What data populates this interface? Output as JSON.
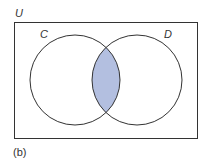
{
  "diagram": {
    "type": "venn",
    "universe_label": "U",
    "sets": [
      {
        "label": "C",
        "cx": 75,
        "cy": 80,
        "r": 45
      },
      {
        "label": "D",
        "cx": 137,
        "cy": 80,
        "r": 45
      }
    ],
    "shaded_region": "C ∩ D",
    "caption": "(b)",
    "colors": {
      "shade": "#b3bfe0",
      "stroke": "#333333",
      "background": "#ffffff"
    }
  }
}
